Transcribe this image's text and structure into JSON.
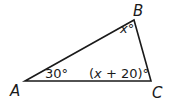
{
  "diagram": {
    "type": "triangle",
    "colors": {
      "stroke": "#1a1a1a",
      "background": "#ffffff"
    },
    "vertices": [
      {
        "name": "A",
        "label": "A"
      },
      {
        "name": "B",
        "label": "B"
      },
      {
        "name": "C",
        "label": "C"
      }
    ],
    "angles": {
      "A": "30°",
      "B": "x°",
      "C": "(x + 20)°"
    },
    "angle_parts": {
      "B_var": "x",
      "B_deg": "°",
      "C_open": "(",
      "C_var": "x",
      "C_rest": " + 20)°"
    }
  }
}
